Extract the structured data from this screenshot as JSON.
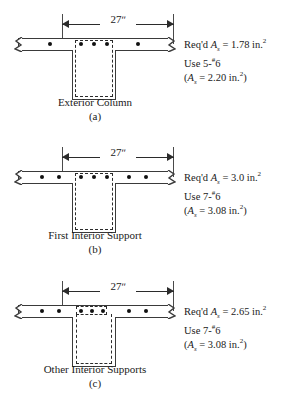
{
  "figure": {
    "type": "reinforced-concrete-t-beam-sections",
    "dimension_label": "27ʺ",
    "panels": [
      {
        "id": "a",
        "caption": "Exterior Column",
        "number": "(a)",
        "bars_total": 5,
        "bars_left": 1,
        "bars_center": 3,
        "bars_right": 1,
        "note": {
          "required_prefix": "Req'd ",
          "as_symbol": "A",
          "as_sub": "s",
          "required_value": " = 1.78 in.",
          "required_exp": "2",
          "use": "Use 5-",
          "use_sup": "#",
          "use_size": "6",
          "provided_open": "(",
          "provided_value": " = 2.20 in.",
          "provided_exp": "2",
          "provided_close": ")"
        }
      },
      {
        "id": "b",
        "caption": "First Interior Support",
        "number": "(b)",
        "bars_total": 7,
        "bars_left": 2,
        "bars_center": 3,
        "bars_right": 2,
        "note": {
          "required_prefix": "Req'd ",
          "as_symbol": "A",
          "as_sub": "s",
          "required_value": " = 3.0 in.",
          "required_exp": "2",
          "use": "Use 7-",
          "use_sup": "#",
          "use_size": "6",
          "provided_open": "(",
          "provided_value": " = 3.08 in.",
          "provided_exp": "2",
          "provided_close": ")"
        }
      },
      {
        "id": "c",
        "caption": "Other Interior Supports",
        "number": "(c)",
        "bars_total": 7,
        "bars_left": 2,
        "bars_center": 3,
        "bars_right": 2,
        "note": {
          "required_prefix": "Req'd ",
          "as_symbol": "A",
          "as_sub": "s",
          "required_value": " = 2.65 in.",
          "required_exp": "2",
          "use": "Use 7-",
          "use_sup": "#",
          "use_size": "6",
          "provided_open": "(",
          "provided_value": " = 3.08 in.",
          "provided_exp": "2",
          "provided_close": ")"
        }
      }
    ],
    "colors": {
      "outline": "#3a3a3a",
      "dashed_cage": "#2b2b2b",
      "bar_dot": "#111111",
      "background": "#ffffff"
    }
  }
}
